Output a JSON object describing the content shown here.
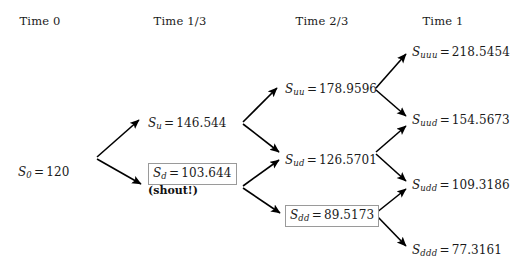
{
  "figure": {
    "type": "binomial-tree",
    "title": "",
    "headers": [
      {
        "label": "Time 0",
        "x": 40
      },
      {
        "label": "Time 1/3",
        "x": 180
      },
      {
        "label": "Time 2/3",
        "x": 322
      },
      {
        "label": "Time 1",
        "x": 443
      }
    ],
    "header_y": 14,
    "stroke_color": "#000000",
    "box_border_color": "#9a9a9a",
    "text_color": "#1a1a1a",
    "nodes": [
      {
        "id": "S0",
        "symbol": "S",
        "subscript": "0",
        "equals": "=",
        "value": "120",
        "x": 18,
        "y": 165,
        "boxed": false,
        "note": ""
      },
      {
        "id": "Su",
        "symbol": "S",
        "subscript": "u",
        "equals": "=",
        "value": "146.544",
        "x": 148,
        "y": 116,
        "boxed": false,
        "note": ""
      },
      {
        "id": "Sd",
        "symbol": "S",
        "subscript": "d",
        "equals": "=",
        "value": "103.644",
        "x": 148,
        "y": 163,
        "boxed": true,
        "note": "(shout!)"
      },
      {
        "id": "Suu",
        "symbol": "S",
        "subscript": "uu",
        "equals": "=",
        "value": "178.9596",
        "x": 285,
        "y": 82,
        "boxed": false,
        "note": ""
      },
      {
        "id": "Sud",
        "symbol": "S",
        "subscript": "ud",
        "equals": "=",
        "value": "126.5701",
        "x": 285,
        "y": 153,
        "boxed": false,
        "note": ""
      },
      {
        "id": "Sdd",
        "symbol": "S",
        "subscript": "dd",
        "equals": "=",
        "value": "89.5173",
        "x": 285,
        "y": 205,
        "boxed": true,
        "note": ""
      },
      {
        "id": "Suuu",
        "symbol": "S",
        "subscript": "uuu",
        "equals": "=",
        "value": "218.5454",
        "x": 412,
        "y": 45,
        "boxed": false,
        "note": ""
      },
      {
        "id": "Suud",
        "symbol": "S",
        "subscript": "uud",
        "equals": "=",
        "value": "154.5673",
        "x": 412,
        "y": 113,
        "boxed": false,
        "note": ""
      },
      {
        "id": "Sudd",
        "symbol": "S",
        "subscript": "udd",
        "equals": "=",
        "value": "109.3186",
        "x": 412,
        "y": 178,
        "boxed": false,
        "note": ""
      },
      {
        "id": "Sddd",
        "symbol": "S",
        "subscript": "ddd",
        "equals": "=",
        "value": "77.3161",
        "x": 412,
        "y": 243,
        "boxed": false,
        "note": ""
      }
    ],
    "edges": [
      {
        "from": "S0",
        "to": "Su",
        "x1": 97,
        "y1": 157,
        "x2": 139,
        "y2": 120
      },
      {
        "from": "S0",
        "to": "Sd",
        "x1": 97,
        "y1": 159,
        "x2": 141,
        "y2": 184
      },
      {
        "from": "Su",
        "to": "Suu",
        "x1": 243,
        "y1": 122,
        "x2": 277,
        "y2": 88
      },
      {
        "from": "Su",
        "to": "Sud",
        "x1": 243,
        "y1": 124,
        "x2": 279,
        "y2": 152
      },
      {
        "from": "Sd",
        "to": "Sud",
        "x1": 243,
        "y1": 186,
        "x2": 279,
        "y2": 160
      },
      {
        "from": "Sd",
        "to": "Sdd",
        "x1": 243,
        "y1": 188,
        "x2": 280,
        "y2": 213
      },
      {
        "from": "Suu",
        "to": "Suuu",
        "x1": 376,
        "y1": 88,
        "x2": 406,
        "y2": 54
      },
      {
        "from": "Suu",
        "to": "Suud",
        "x1": 376,
        "y1": 90,
        "x2": 406,
        "y2": 116
      },
      {
        "from": "Sud",
        "to": "Suud",
        "x1": 376,
        "y1": 152,
        "x2": 406,
        "y2": 126
      },
      {
        "from": "Sud",
        "to": "Sudd",
        "x1": 376,
        "y1": 154,
        "x2": 406,
        "y2": 181
      },
      {
        "from": "Sdd",
        "to": "Sudd",
        "x1": 376,
        "y1": 213,
        "x2": 406,
        "y2": 189
      },
      {
        "from": "Sdd",
        "to": "Sddd",
        "x1": 376,
        "y1": 215,
        "x2": 406,
        "y2": 246
      }
    ]
  },
  "chart_data": {
    "type": "diagram",
    "periods": [
      "Time 0",
      "Time 1/3",
      "Time 2/3",
      "Time 1"
    ],
    "values": {
      "S0": 120,
      "Su": 146.544,
      "Sd": 103.644,
      "Suu": 178.9596,
      "Sud": 126.5701,
      "Sdd": 89.5173,
      "Suuu": 218.5454,
      "Suud": 154.5673,
      "Sudd": 109.3186,
      "Sddd": 77.3161
    },
    "highlighted_nodes": [
      "Sd",
      "Sdd"
    ],
    "annotations": [
      {
        "node": "Sd",
        "text": "(shout!)"
      }
    ]
  }
}
